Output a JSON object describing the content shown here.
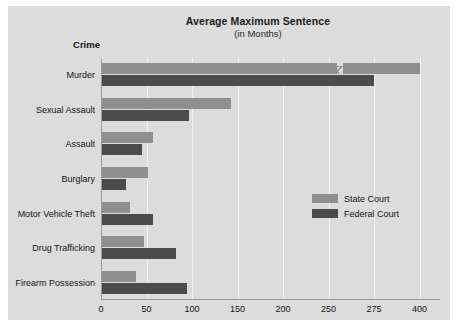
{
  "chart_data": {
    "type": "bar",
    "orientation": "horizontal",
    "title": "Average Maximum Sentence",
    "subtitle": "(in Months)",
    "xlabel": "",
    "ylabel": "Crime",
    "categories": [
      "Murder",
      "Sexual Assault",
      "Assault",
      "Burglary",
      "Motor Vehicle Theft",
      "Drug Trafficking",
      "Firearm Possession"
    ],
    "series": [
      {
        "name": "State Court",
        "color": "#8f8f8f",
        "values": [
          400,
          143,
          57,
          52,
          32,
          47,
          38
        ]
      },
      {
        "name": "Federal Court",
        "color": "#4b4b4b",
        "values": [
          275,
          97,
          45,
          27,
          57,
          82,
          95
        ]
      }
    ],
    "tick_labels": [
      "0",
      "50",
      "100",
      "150",
      "200",
      "250",
      "275",
      "400"
    ],
    "tick_values": [
      0,
      50,
      100,
      150,
      200,
      250,
      275,
      400
    ],
    "axis_break": true,
    "axis_break_after": 250,
    "grid": true,
    "legend_position": "inside-right"
  },
  "legend": {
    "items": [
      {
        "label": "State Court"
      },
      {
        "label": "Federal Court"
      }
    ]
  },
  "colors": {
    "panel_background": "#dcdcdc",
    "state_court": "#8f8f8f",
    "federal_court": "#4b4b4b",
    "gridline": "#f2f2f2",
    "axis": "#9a9a9a"
  }
}
